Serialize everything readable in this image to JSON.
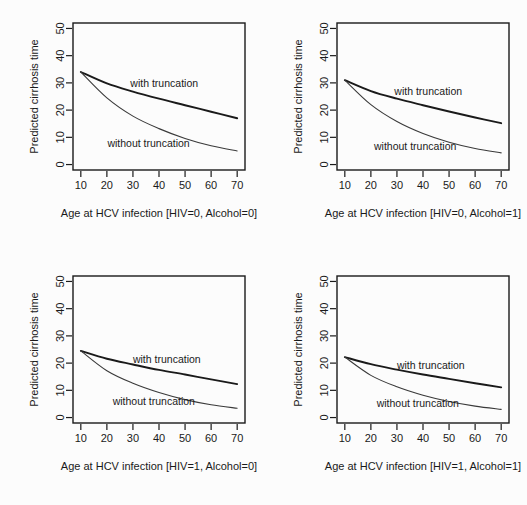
{
  "figure": {
    "background": "#fcfcfc",
    "ink": "#1a1a1a",
    "panel_count": 4,
    "layout": "2x2"
  },
  "chart_data": [
    {
      "type": "line",
      "title": "",
      "xlabel": "Age at HCV infection [HIV=0, Alcohol=0]",
      "ylabel": "Predicted cirrhosis time",
      "xlim": [
        7,
        73
      ],
      "ylim": [
        -2,
        52
      ],
      "xticks": [
        10,
        20,
        30,
        40,
        50,
        60,
        70
      ],
      "yticks": [
        0,
        10,
        20,
        30,
        40,
        50
      ],
      "grid": false,
      "legend": "inline-annotations",
      "x": [
        10,
        20,
        30,
        40,
        50,
        60,
        70
      ],
      "series": [
        {
          "name": "with truncation",
          "values": [
            34.0,
            29.8,
            26.8,
            24.2,
            21.8,
            19.4,
            17.0
          ]
        },
        {
          "name": "without truncation",
          "values": [
            34.0,
            24.5,
            17.8,
            13.2,
            9.6,
            6.9,
            5.0
          ]
        }
      ],
      "annotations": [
        {
          "text": "with truncation",
          "x": 42,
          "y": 28.5
        },
        {
          "text": "without truncation",
          "x": 36,
          "y": 6.5
        }
      ]
    },
    {
      "type": "line",
      "title": "",
      "xlabel": "Age at HCV infection [HIV=0, Alcohol=1]",
      "ylabel": "Predicted cirrhosis time",
      "xlim": [
        7,
        73
      ],
      "ylim": [
        -2,
        52
      ],
      "xticks": [
        10,
        20,
        30,
        40,
        50,
        60,
        70
      ],
      "yticks": [
        0,
        10,
        20,
        30,
        40,
        50
      ],
      "grid": false,
      "legend": "inline-annotations",
      "x": [
        10,
        20,
        30,
        40,
        50,
        60,
        70
      ],
      "series": [
        {
          "name": "with truncation",
          "values": [
            31.0,
            27.0,
            24.2,
            21.8,
            19.5,
            17.3,
            15.2
          ]
        },
        {
          "name": "without truncation",
          "values": [
            31.0,
            22.0,
            15.8,
            11.4,
            8.2,
            5.9,
            4.3
          ]
        }
      ],
      "annotations": [
        {
          "text": "with truncation",
          "x": 42,
          "y": 25.5
        },
        {
          "text": "without truncation",
          "x": 37,
          "y": 5.5
        }
      ]
    },
    {
      "type": "line",
      "title": "",
      "xlabel": "Age at HCV infection [HIV=1, Alcohol=0]",
      "ylabel": "Predicted cirrhosis time",
      "xlim": [
        7,
        73
      ],
      "ylim": [
        -2,
        52
      ],
      "xticks": [
        10,
        20,
        30,
        40,
        50,
        60,
        70
      ],
      "yticks": [
        0,
        10,
        20,
        30,
        40,
        50
      ],
      "grid": false,
      "legend": "inline-annotations",
      "x": [
        10,
        20,
        30,
        40,
        50,
        60,
        70
      ],
      "series": [
        {
          "name": "with truncation",
          "values": [
            24.5,
            21.6,
            19.5,
            17.5,
            15.8,
            14.0,
            12.3
          ]
        },
        {
          "name": "without truncation",
          "values": [
            24.5,
            17.2,
            12.6,
            9.2,
            6.6,
            4.7,
            3.4
          ]
        }
      ],
      "annotations": [
        {
          "text": "with truncation",
          "x": 43,
          "y": 20.0
        },
        {
          "text": "without truncation",
          "x": 38,
          "y": 4.5
        }
      ]
    },
    {
      "type": "line",
      "title": "",
      "xlabel": "Age at HCV infection [HIV=1, Alcohol=1]",
      "ylabel": "Predicted cirrhosis time",
      "xlim": [
        7,
        73
      ],
      "ylim": [
        -2,
        52
      ],
      "xticks": [
        10,
        20,
        30,
        40,
        50,
        60,
        70
      ],
      "yticks": [
        0,
        10,
        20,
        30,
        40,
        50
      ],
      "grid": false,
      "legend": "inline-annotations",
      "x": [
        10,
        20,
        30,
        40,
        50,
        60,
        70
      ],
      "series": [
        {
          "name": "with truncation",
          "values": [
            22.2,
            19.6,
            17.6,
            15.8,
            14.2,
            12.6,
            11.1
          ]
        },
        {
          "name": "without truncation",
          "values": [
            22.2,
            15.5,
            11.3,
            8.2,
            5.9,
            4.2,
            3.0
          ]
        }
      ],
      "annotations": [
        {
          "text": "with truncation",
          "x": 43,
          "y": 18.0
        },
        {
          "text": "without truncation",
          "x": 38,
          "y": 4.0
        }
      ]
    }
  ]
}
